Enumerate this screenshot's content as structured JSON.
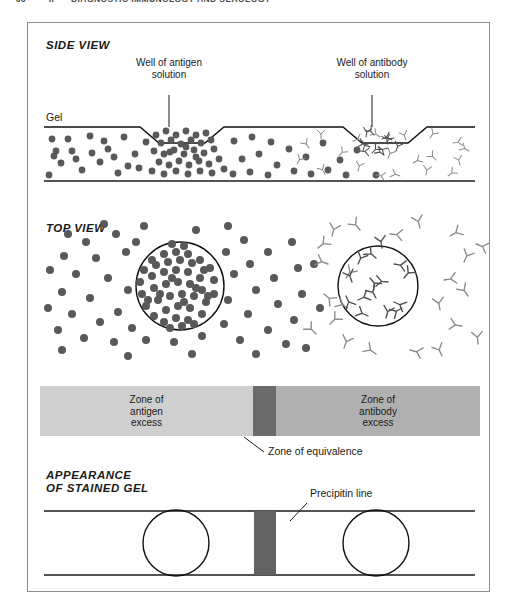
{
  "running_head": {
    "folio": "66",
    "part": "II",
    "title": "DIAGNOSTIC IMMUNOLOGY AND SEROLOGY"
  },
  "figure": {
    "panels": {
      "side_view": {
        "section_label": "SIDE VIEW",
        "gel_label": "Gel",
        "left_callout": "Well of\nantigen\nsolution",
        "right_callout": "Well of\nantibody\nsolution"
      },
      "top_view": {
        "section_label": "TOP VIEW"
      },
      "zone_bar": {
        "left_label": "Zone of\nantigen\nexcess",
        "middle_label": "",
        "right_label": "Zone of\nantibody\nexcess",
        "equivalence_callout": "Zone of equivalence"
      },
      "stained_gel": {
        "section_label": "APPEARANCE\nOF STAINED GEL",
        "precipitin_callout": "Precipitin line"
      }
    },
    "colors": {
      "frame_stroke": "#8d8d8d",
      "rule_stroke": "#1a1a1a",
      "antigen_dot": "#595959",
      "antibody_stroke": "#8a8a8a",
      "antibody_dense_stroke": "#4f4f4f",
      "zone_antigen_excess": "#cfcfcf",
      "zone_equivalence": "#6b6b6b",
      "zone_antibody_excess": "#b0b0b0",
      "precipitin_band": "#636363",
      "page_background": "#ffffff"
    },
    "geometry": {
      "frame": {
        "x": 27,
        "y": 22,
        "w": 463,
        "h": 570
      },
      "side_view_band": {
        "top": 125,
        "bottom": 180
      },
      "top_view_band": {
        "top": 210,
        "bottom": 350
      },
      "zone_bar": {
        "x": 12,
        "y": 363,
        "w": 440,
        "h": 50
      },
      "stained_gel_band": {
        "top": 483,
        "bottom": 570
      },
      "equivalence_center_x": 240
    }
  }
}
